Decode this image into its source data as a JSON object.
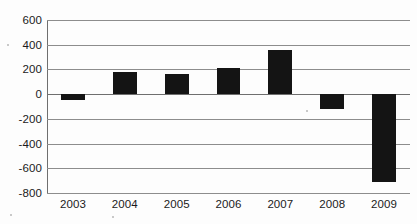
{
  "chart_data": {
    "type": "bar",
    "title": "",
    "subtitle": "",
    "xlabel": "",
    "ylabel": "",
    "categories": [
      "2003",
      "2004",
      "2005",
      "2006",
      "2007",
      "2008",
      "2009"
    ],
    "values": [
      -50,
      180,
      165,
      215,
      355,
      -120,
      -715
    ],
    "series": [
      {
        "name": "",
        "values": [
          -50,
          180,
          165,
          215,
          355,
          -120,
          -715
        ]
      }
    ],
    "ylim": [
      -800,
      600
    ],
    "y_ticks": [
      600,
      400,
      200,
      0,
      -200,
      -400,
      -600,
      -800
    ],
    "y_tick_labels": [
      "600",
      "400",
      "200",
      "0",
      "-200",
      "-400",
      "-600",
      "-800"
    ],
    "grid": true,
    "legend": false,
    "legend_position": "none",
    "bar_color": "#141414",
    "gridline_color": "#8d8d8d",
    "background_color": "#fdfdfd",
    "text_color": "#1b1b1b"
  }
}
